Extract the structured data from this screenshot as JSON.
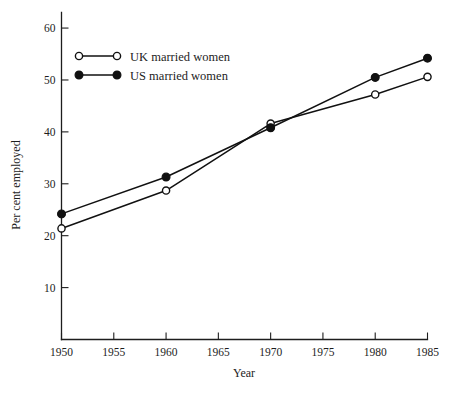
{
  "chart_data": {
    "type": "line",
    "title": "",
    "subtitle": "",
    "xlabel": "Year",
    "ylabel": "Per cent employed",
    "x": [
      1950,
      1960,
      1970,
      1980,
      1985
    ],
    "xlim": [
      1950,
      1985
    ],
    "ylim": [
      0,
      63
    ],
    "xticks": [
      1950,
      1955,
      1960,
      1965,
      1970,
      1975,
      1980,
      1985
    ],
    "xtick_labels": [
      "1950",
      "1955",
      "1960",
      "1965",
      "1970",
      "1975",
      "1980",
      "1985"
    ],
    "yticks": [
      10,
      20,
      30,
      40,
      50,
      60
    ],
    "ytick_labels": [
      "10",
      "20",
      "30",
      "40",
      "50",
      "60"
    ],
    "grid": false,
    "legend_position": "upper-left",
    "series": [
      {
        "name": "UK married women",
        "marker": "open-circle",
        "color": "#111111",
        "x": [
          1950,
          1960,
          1970,
          1980,
          1985
        ],
        "values": [
          21.4,
          28.7,
          41.6,
          47.2,
          50.6
        ]
      },
      {
        "name": "US married women",
        "marker": "filled-circle",
        "color": "#111111",
        "x": [
          1950,
          1960,
          1970,
          1980,
          1985
        ],
        "values": [
          24.2,
          31.3,
          40.8,
          50.5,
          54.2
        ]
      }
    ]
  },
  "legend": {
    "entries": [
      {
        "label": "UK married women",
        "marker": "open-circle"
      },
      {
        "label": "US married women",
        "marker": "filled-circle"
      }
    ]
  },
  "axes": {
    "x_title": "Year",
    "y_title": "Per cent employed"
  }
}
